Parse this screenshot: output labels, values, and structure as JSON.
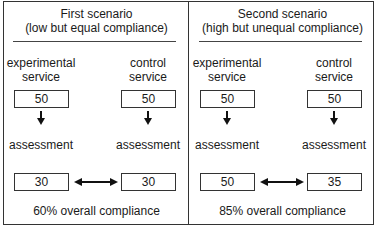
{
  "scenarios": [
    {
      "title": "First scenario",
      "subtitle": "(low but equal compliance)",
      "experimental": {
        "label_line1": "experimental",
        "label_line2": "service",
        "start_value": "50",
        "assessment_label": "assessment",
        "end_value": "30"
      },
      "control": {
        "label_line1": "control",
        "label_line2": "service",
        "start_value": "50",
        "assessment_label": "assessment",
        "end_value": "30"
      },
      "overall": "60% overall compliance"
    },
    {
      "title": "Second scenario",
      "subtitle": "(high but unequal compliance)",
      "experimental": {
        "label_line1": "experimental",
        "label_line2": "service",
        "start_value": "50",
        "assessment_label": "assessment",
        "end_value": "50"
      },
      "control": {
        "label_line1": "control",
        "label_line2": "service",
        "start_value": "50",
        "assessment_label": "assessment",
        "end_value": "35"
      },
      "overall": "85% overall compliance"
    }
  ]
}
